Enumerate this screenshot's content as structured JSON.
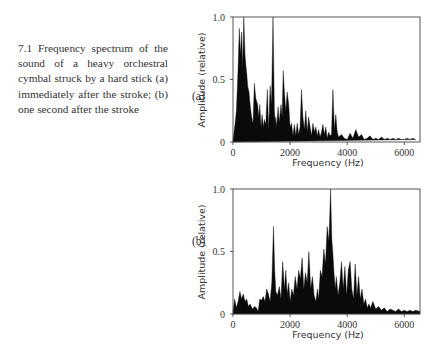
{
  "caption": {
    "text": "7.1 Frequency spectrum of the sound of a heavy orchestral cymbal struck by a hard stick (a) immediately after the stroke; (b) one second after the stroke"
  },
  "panels": [
    {
      "label": "(a)"
    },
    {
      "label": "(b)"
    }
  ],
  "chart_data": [
    {
      "type": "area",
      "panel": "(a)",
      "title": "",
      "xlabel": "Frequency (Hz)",
      "ylabel": "Amplitude (relative)",
      "xlim": [
        0,
        6550
      ],
      "ylim": [
        0,
        1.0
      ],
      "xticks": [
        0,
        2000,
        4000,
        6000
      ],
      "yticks": [
        0,
        0.5,
        1.0
      ],
      "ytick_labels": [
        "0",
        "0.5",
        "1.0"
      ],
      "grid": false,
      "x": [
        0,
        60,
        120,
        170,
        220,
        260,
        300,
        340,
        380,
        420,
        450,
        480,
        520,
        560,
        600,
        650,
        700,
        750,
        800,
        860,
        900,
        940,
        980,
        1020,
        1060,
        1100,
        1150,
        1200,
        1250,
        1300,
        1350,
        1400,
        1450,
        1480,
        1500,
        1530,
        1580,
        1620,
        1680,
        1720,
        1760,
        1800,
        1850,
        1900,
        1950,
        2000,
        2050,
        2100,
        2150,
        2200,
        2250,
        2300,
        2350,
        2400,
        2450,
        2500,
        2550,
        2600,
        2650,
        2700,
        2750,
        2800,
        2850,
        2900,
        2950,
        3000,
        3050,
        3100,
        3150,
        3200,
        3250,
        3300,
        3350,
        3400,
        3450,
        3500,
        3550,
        3600,
        3650,
        3700,
        3800,
        3900,
        4000,
        4100,
        4200,
        4300,
        4400,
        4500,
        4600,
        4700,
        4800,
        4900,
        5000,
        5100,
        5200,
        5300,
        5400,
        5500,
        5600,
        5700,
        5800,
        5900,
        6000,
        6100,
        6200,
        6300,
        6400,
        6550
      ],
      "values": [
        0.02,
        0.12,
        0.25,
        0.55,
        0.91,
        0.7,
        0.88,
        0.6,
        1.0,
        0.7,
        0.62,
        0.55,
        0.44,
        0.4,
        0.3,
        0.2,
        0.15,
        0.47,
        0.35,
        0.3,
        0.2,
        0.3,
        0.12,
        0.22,
        0.12,
        0.18,
        0.14,
        0.42,
        0.1,
        0.45,
        0.3,
        1.0,
        0.25,
        0.15,
        0.2,
        0.12,
        0.28,
        0.16,
        0.3,
        0.2,
        0.57,
        0.4,
        0.25,
        0.4,
        0.3,
        0.12,
        0.15,
        0.05,
        0.14,
        0.05,
        0.15,
        0.06,
        0.12,
        0.42,
        0.2,
        0.1,
        0.25,
        0.08,
        0.2,
        0.12,
        0.05,
        0.15,
        0.08,
        0.12,
        0.05,
        0.1,
        0.04,
        0.08,
        0.14,
        0.06,
        0.12,
        0.03,
        0.08,
        0.05,
        0.06,
        0.42,
        0.1,
        0.22,
        0.08,
        0.04,
        0.06,
        0.03,
        0.02,
        0.07,
        0.03,
        0.1,
        0.04,
        0.06,
        0.02,
        0.03,
        0.05,
        0.02,
        0.03,
        0.02,
        0.04,
        0.02,
        0.03,
        0.02,
        0.03,
        0.02,
        0.03,
        0.02,
        0.02,
        0.03,
        0.02,
        0.03,
        0.02
      ]
    },
    {
      "type": "area",
      "panel": "(b)",
      "title": "",
      "xlabel": "Frequency (Hz)",
      "ylabel": "Amplitude (relative)",
      "xlim": [
        0,
        6550
      ],
      "ylim": [
        0,
        1.0
      ],
      "xticks": [
        0,
        2000,
        4000,
        6000
      ],
      "yticks": [
        0,
        0.5,
        1.0
      ],
      "ytick_labels": [
        "0",
        "0.5",
        "1.0"
      ],
      "grid": false,
      "x": [
        0,
        60,
        120,
        180,
        240,
        300,
        360,
        420,
        480,
        540,
        600,
        680,
        760,
        820,
        880,
        940,
        1000,
        1060,
        1120,
        1180,
        1240,
        1300,
        1360,
        1420,
        1460,
        1500,
        1560,
        1620,
        1680,
        1740,
        1800,
        1850,
        1900,
        1950,
        2000,
        2060,
        2120,
        2180,
        2240,
        2300,
        2360,
        2420,
        2480,
        2540,
        2600,
        2660,
        2720,
        2780,
        2840,
        2900,
        2960,
        3000,
        3060,
        3120,
        3180,
        3240,
        3300,
        3360,
        3420,
        3460,
        3500,
        3540,
        3580,
        3620,
        3680,
        3740,
        3800,
        3860,
        3920,
        3980,
        4040,
        4100,
        4160,
        4220,
        4280,
        4340,
        4400,
        4460,
        4520,
        4580,
        4640,
        4700,
        4760,
        4820,
        4900,
        5000,
        5100,
        5200,
        5300,
        5400,
        5500,
        5600,
        5700,
        5800,
        5900,
        6000,
        6100,
        6200,
        6300,
        6400,
        6550
      ],
      "values": [
        0.02,
        0.12,
        0.05,
        0.1,
        0.18,
        0.12,
        0.16,
        0.1,
        0.12,
        0.06,
        0.08,
        0.04,
        0.06,
        0.05,
        0.02,
        0.12,
        0.11,
        0.14,
        0.1,
        0.2,
        0.16,
        0.1,
        0.25,
        0.7,
        0.35,
        0.18,
        0.15,
        0.22,
        0.12,
        0.42,
        0.2,
        0.35,
        0.16,
        0.25,
        0.1,
        0.2,
        0.15,
        0.3,
        0.2,
        0.35,
        0.28,
        0.45,
        0.2,
        0.33,
        0.25,
        0.5,
        0.2,
        0.3,
        0.15,
        0.1,
        0.2,
        0.12,
        0.35,
        0.3,
        0.52,
        0.4,
        0.7,
        0.58,
        1.0,
        0.6,
        0.48,
        0.32,
        0.2,
        0.3,
        0.15,
        0.25,
        0.42,
        0.2,
        0.38,
        0.15,
        0.35,
        0.42,
        0.2,
        0.12,
        0.4,
        0.15,
        0.3,
        0.12,
        0.2,
        0.08,
        0.12,
        0.05,
        0.08,
        0.05,
        0.1,
        0.04,
        0.06,
        0.03,
        0.05,
        0.02,
        0.04,
        0.03,
        0.02,
        0.04,
        0.02,
        0.03,
        0.02,
        0.03,
        0.02,
        0.03,
        0.02
      ]
    }
  ]
}
